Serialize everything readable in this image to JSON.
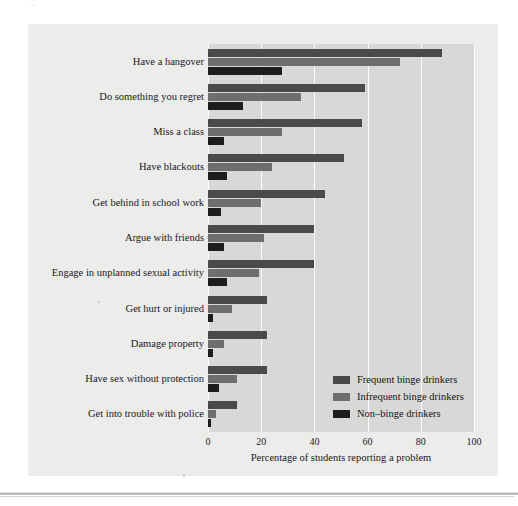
{
  "page": {
    "top_cut_text": "...",
    "figure_bg": "#ececeb",
    "plot_bg": "#d8d8d6",
    "gridline_color": "#fbfbfa"
  },
  "axis": {
    "xlabel": "Percentage of students reporting a problem",
    "ticks": [
      "0",
      "20",
      "40",
      "60",
      "80",
      "100"
    ]
  },
  "legend": {
    "entries": [
      {
        "label": "Frequent binge drinkers",
        "color": "#4a4a4a",
        "icon": "legend-swatch-icon"
      },
      {
        "label": "Infrequent binge drinkers",
        "color": "#6e6e6e",
        "icon": "legend-swatch-icon"
      },
      {
        "label": "Non–binge drinkers",
        "color": "#1d1d1d",
        "icon": "legend-swatch-icon"
      }
    ]
  },
  "chart_data": {
    "type": "bar",
    "orientation": "horizontal",
    "title": "",
    "xlabel": "Percentage of students reporting a problem",
    "ylabel": "",
    "xlim": [
      0,
      100
    ],
    "xticks": [
      0,
      20,
      40,
      60,
      80,
      100
    ],
    "grid": "vertical-white-gridlines",
    "legend_position": "inside lower-right",
    "categories": [
      "Have a hangover",
      "Do something you regret",
      "Miss a class",
      "Have blackouts",
      "Get behind in school work",
      "Argue with friends",
      "Engage in unplanned sexual activity",
      "Get hurt or injured",
      "Damage property",
      "Have sex without protection",
      "Get into trouble with police"
    ],
    "series": [
      {
        "name": "Frequent binge drinkers",
        "color": "#4a4a4a",
        "values": [
          88,
          59,
          58,
          51,
          44,
          40,
          40,
          22,
          22,
          22,
          11
        ]
      },
      {
        "name": "Infrequent binge drinkers",
        "color": "#6e6e6e",
        "values": [
          72,
          35,
          28,
          24,
          20,
          21,
          19,
          9,
          6,
          11,
          3
        ]
      },
      {
        "name": "Non–binge drinkers",
        "color": "#1d1d1d",
        "values": [
          28,
          13,
          6,
          7,
          5,
          6,
          7,
          2,
          2,
          4,
          1
        ]
      }
    ]
  }
}
